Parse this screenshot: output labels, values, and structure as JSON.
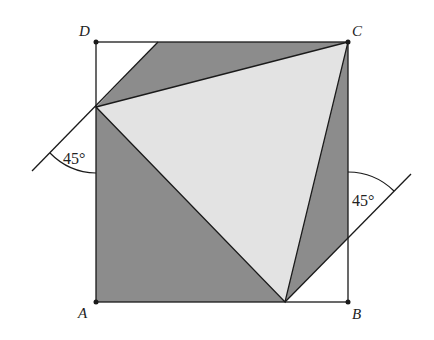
{
  "diagram": {
    "type": "geometry-square-folded-triangle",
    "colors": {
      "background": "#ffffff",
      "stroke": "#1a1a1a",
      "shaded": "#8c8c8c",
      "triangle_fill": "#e3e3e3"
    },
    "vertices": {
      "A": {
        "label": "A"
      },
      "B": {
        "label": "B"
      },
      "C": {
        "label": "C"
      },
      "D": {
        "label": "D"
      }
    },
    "angles": [
      {
        "label": "45°",
        "position": "left, at point on side AD"
      },
      {
        "label": "45°",
        "position": "right, at point on side AB"
      }
    ]
  }
}
